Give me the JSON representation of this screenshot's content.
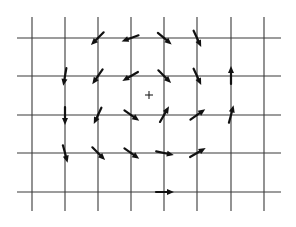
{
  "diagram": {
    "title": "",
    "colors": {
      "background": "#ffffff",
      "grid": "#3a3a3a",
      "arrow": "#111111",
      "center": "#222222"
    },
    "grid": {
      "vertical_x": [
        32,
        65,
        98,
        131,
        164,
        197,
        231,
        264
      ],
      "vertical_y_range": [
        17,
        211
      ],
      "horizontal_y": [
        38,
        76,
        115,
        153,
        192
      ],
      "horizontal_x_range": [
        17,
        281
      ]
    },
    "center_marker": {
      "symbol": "+",
      "x": 149,
      "y": 95
    },
    "arrows": [
      {
        "x": 98,
        "y": 38,
        "angle": 135
      },
      {
        "x": 131,
        "y": 38,
        "angle": 160
      },
      {
        "x": 164,
        "y": 38,
        "angle": 40
      },
      {
        "x": 197,
        "y": 38,
        "angle": 65
      },
      {
        "x": 65,
        "y": 76,
        "angle": 100
      },
      {
        "x": 98,
        "y": 76,
        "angle": 125
      },
      {
        "x": 131,
        "y": 76,
        "angle": 150
      },
      {
        "x": 164,
        "y": 76,
        "angle": 45
      },
      {
        "x": 197,
        "y": 76,
        "angle": 65
      },
      {
        "x": 231,
        "y": 76,
        "angle": -90
      },
      {
        "x": 65,
        "y": 115,
        "angle": 90
      },
      {
        "x": 98,
        "y": 115,
        "angle": 115
      },
      {
        "x": 131,
        "y": 115,
        "angle": 35
      },
      {
        "x": 164,
        "y": 115,
        "angle": -60
      },
      {
        "x": 197,
        "y": 115,
        "angle": -35
      },
      {
        "x": 231,
        "y": 115,
        "angle": -75
      },
      {
        "x": 65,
        "y": 153,
        "angle": 75
      },
      {
        "x": 98,
        "y": 153,
        "angle": 45
      },
      {
        "x": 131,
        "y": 153,
        "angle": 35
      },
      {
        "x": 164,
        "y": 153,
        "angle": 12
      },
      {
        "x": 197,
        "y": 153,
        "angle": -30
      },
      {
        "x": 164,
        "y": 192,
        "angle": 0
      }
    ]
  }
}
